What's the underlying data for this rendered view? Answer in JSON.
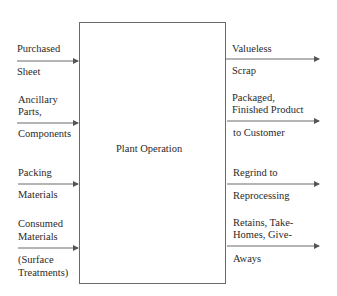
{
  "diagram": {
    "center": {
      "label": "Plant Operation"
    },
    "inputs": [
      {
        "above": [
          "Purchased"
        ],
        "below": [
          "Sheet"
        ]
      },
      {
        "above": [
          "Ancillary",
          "Parts,"
        ],
        "below": [
          "Components"
        ]
      },
      {
        "above": [
          "Packing"
        ],
        "below": [
          "Materials"
        ]
      },
      {
        "above": [
          "Consumed",
          "Materials"
        ],
        "below": [
          "(Surface",
          "Treatments)"
        ]
      }
    ],
    "outputs": [
      {
        "above": [
          "Valueless"
        ],
        "below": [
          "Scrap"
        ]
      },
      {
        "above": [
          "Packaged,",
          "Finished Product"
        ],
        "below": [
          "to Customer"
        ]
      },
      {
        "above": [
          "Regrind to"
        ],
        "below": [
          "Reprocessing"
        ]
      },
      {
        "above": [
          "Retains, Take-",
          "Homes, Give-"
        ],
        "below": [
          "Aways"
        ]
      }
    ],
    "colors": {
      "line": "#6a6a6a",
      "text": "#2a2a2a",
      "background": "#ffffff"
    }
  }
}
